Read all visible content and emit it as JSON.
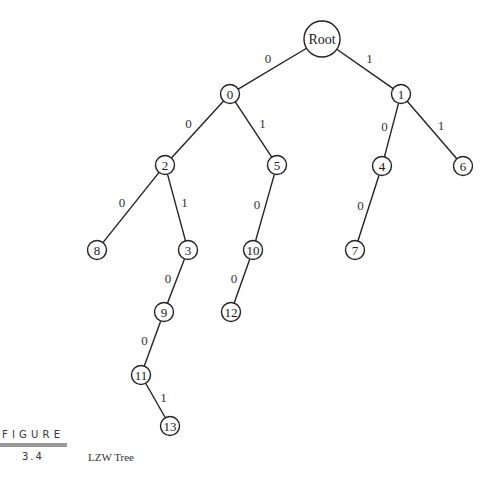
{
  "figure": {
    "label": "FIGURE",
    "number": "3.4",
    "caption": "LZW Tree"
  },
  "tree": {
    "nodes": [
      {
        "id": "root",
        "label": "Root"
      },
      {
        "id": "n0",
        "label": "0"
      },
      {
        "id": "n1",
        "label": "1"
      },
      {
        "id": "n2",
        "label": "2"
      },
      {
        "id": "n5",
        "label": "5"
      },
      {
        "id": "n4",
        "label": "4"
      },
      {
        "id": "n6",
        "label": "6"
      },
      {
        "id": "n8",
        "label": "8"
      },
      {
        "id": "n3",
        "label": "3"
      },
      {
        "id": "n10",
        "label": "10"
      },
      {
        "id": "n7",
        "label": "7"
      },
      {
        "id": "n9",
        "label": "9"
      },
      {
        "id": "n12",
        "label": "12"
      },
      {
        "id": "n11",
        "label": "11"
      },
      {
        "id": "n13",
        "label": "13"
      }
    ],
    "edges": [
      {
        "from": "root",
        "to": "n0",
        "bit": "0"
      },
      {
        "from": "root",
        "to": "n1",
        "bit": "1"
      },
      {
        "from": "n0",
        "to": "n2",
        "bit": "0"
      },
      {
        "from": "n0",
        "to": "n5",
        "bit": "1"
      },
      {
        "from": "n1",
        "to": "n4",
        "bit": "0"
      },
      {
        "from": "n1",
        "to": "n6",
        "bit": "1"
      },
      {
        "from": "n2",
        "to": "n8",
        "bit": "0"
      },
      {
        "from": "n2",
        "to": "n3",
        "bit": "1"
      },
      {
        "from": "n5",
        "to": "n10",
        "bit": "0"
      },
      {
        "from": "n4",
        "to": "n7",
        "bit": "0"
      },
      {
        "from": "n3",
        "to": "n9",
        "bit": "0"
      },
      {
        "from": "n10",
        "to": "n12",
        "bit": "0"
      },
      {
        "from": "n9",
        "to": "n11",
        "bit": "0"
      },
      {
        "from": "n11",
        "to": "n13",
        "bit": "1"
      }
    ]
  }
}
